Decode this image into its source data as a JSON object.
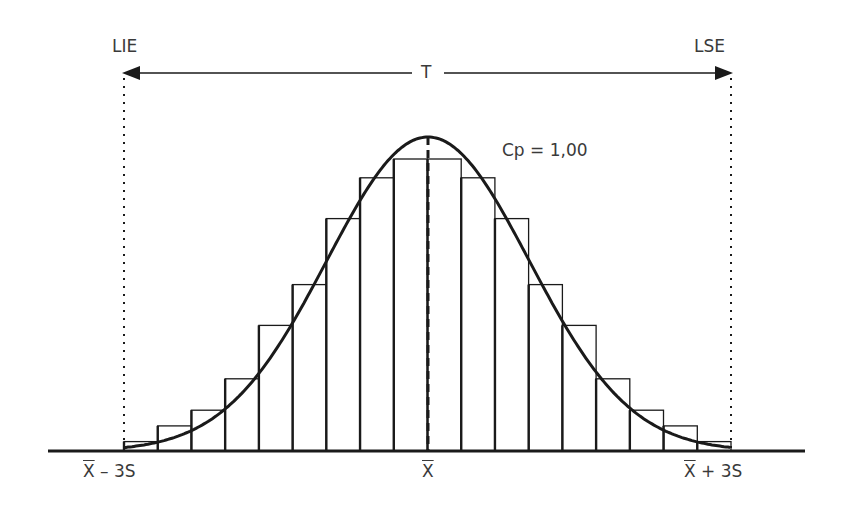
{
  "labels": {
    "lower_spec": "LIE",
    "upper_spec": "LSE",
    "tolerance": "T",
    "capability": "Cp = 1,00",
    "mean_symbol": "X",
    "minus_3s_suffix": " – 3S",
    "plus_3s_suffix": " + 3S"
  },
  "colors": {
    "ink": "#1a1a1a",
    "text": "#3a3a3a",
    "background": "#ffffff"
  },
  "chart_data": {
    "type": "bar",
    "title": "",
    "bins": 18,
    "relative_heights": [
      0.03,
      0.08,
      0.13,
      0.23,
      0.4,
      0.53,
      0.74,
      0.87,
      0.93,
      0.93,
      0.87,
      0.74,
      0.53,
      0.4,
      0.23,
      0.13,
      0.08,
      0.03
    ],
    "x_markers": [
      "X̄ − 3S",
      "X̄",
      "X̄ + 3S"
    ],
    "spec_limits": [
      "LIE",
      "LSE"
    ],
    "annotations": [
      "T",
      "Cp = 1,00"
    ],
    "curve": "normal"
  }
}
